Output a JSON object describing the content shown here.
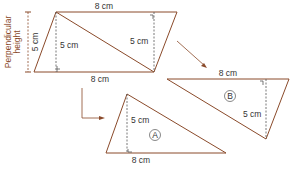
{
  "parallelogram": {
    "top_label": "8 cm",
    "bottom_label": "8 cm",
    "inner_height_label": "5 cm",
    "right_height_label": "5 cm",
    "perpendicular_label_line1": "Perpendicular",
    "perpendicular_label_line2": "height",
    "perpendicular_value": "5 cm"
  },
  "triangle_a": {
    "id": "A",
    "base_label": "8 cm",
    "height_label": "5 cm"
  },
  "triangle_b": {
    "id": "B",
    "base_label": "8 cm",
    "height_label": "5 cm"
  },
  "colors": {
    "outline": "#8a4a2a",
    "text": "#333333"
  }
}
